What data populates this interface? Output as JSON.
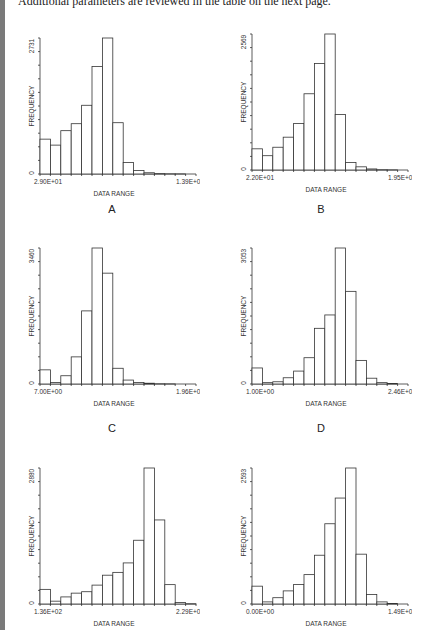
{
  "intro_text": "Additional parameters are reviewed in the table on the next page.",
  "chart_data": [
    {
      "type": "bar",
      "panel": "A",
      "title": "",
      "xlabel": "DATA RANGE",
      "ylabel": "FREQUENCY",
      "x_min_label": "2.90E+01",
      "x_max_label": "1.39E+02",
      "y_min_label": "0",
      "y_max_label": "2731",
      "ylim": [
        0,
        2731
      ],
      "bins": 15,
      "values": [
        700,
        580,
        870,
        1010,
        1380,
        2160,
        2731,
        1030,
        230,
        70,
        25,
        8,
        3,
        1,
        0
      ],
      "grid": false
    },
    {
      "type": "bar",
      "panel": "B",
      "title": "",
      "xlabel": "DATA RANGE",
      "ylabel": "FREQUENCY",
      "x_min_label": "2.20E+01",
      "x_max_label": "1.95E+02",
      "y_min_label": "0",
      "y_max_label": "2569",
      "ylim": [
        0,
        2569
      ],
      "bins": 15,
      "values": [
        400,
        270,
        430,
        620,
        880,
        1440,
        2010,
        2569,
        1050,
        140,
        60,
        20,
        5,
        2,
        0
      ],
      "grid": false
    },
    {
      "type": "bar",
      "panel": "C",
      "title": "",
      "xlabel": "DATA RANGE",
      "ylabel": "FREQUENCY",
      "x_min_label": "7.00E+00",
      "x_max_label": "1.96E+02",
      "y_min_label": "0",
      "y_max_label": "3460",
      "ylim": [
        0,
        3460
      ],
      "bins": 15,
      "values": [
        360,
        40,
        210,
        690,
        1860,
        3460,
        2820,
        400,
        100,
        40,
        20,
        5,
        2,
        0,
        0
      ],
      "grid": false
    },
    {
      "type": "bar",
      "panel": "D",
      "title": "",
      "xlabel": "DATA RANGE",
      "ylabel": "FREQUENCY",
      "x_min_label": "1.00E+00",
      "x_max_label": "2.46E+02",
      "y_min_label": "0",
      "y_max_label": "3053",
      "ylim": [
        0,
        3053
      ],
      "bins": 15,
      "values": [
        360,
        30,
        50,
        140,
        290,
        590,
        1250,
        1550,
        3053,
        2080,
        530,
        130,
        30,
        10,
        0
      ],
      "grid": false
    },
    {
      "type": "bar",
      "panel": "E",
      "title": "",
      "xlabel": "DATA RANGE",
      "ylabel": "FREQUENCY",
      "x_min_label": "1.36E+02",
      "x_max_label": "2.29E+02",
      "y_min_label": "0",
      "y_max_label": "2880",
      "ylim": [
        0,
        2880
      ],
      "bins": 15,
      "values": [
        310,
        60,
        150,
        230,
        260,
        400,
        610,
        670,
        870,
        1350,
        2880,
        1780,
        410,
        30,
        5
      ],
      "grid": false
    },
    {
      "type": "bar",
      "panel": "F",
      "title": "",
      "xlabel": "DATA RANGE",
      "ylabel": "FREQUENCY",
      "x_min_label": "0.00E+00",
      "x_max_label": "1.49E+02",
      "y_min_label": "0",
      "y_max_label": "2593",
      "ylim": [
        0,
        2593
      ],
      "bins": 15,
      "values": [
        340,
        40,
        120,
        250,
        370,
        560,
        930,
        1530,
        2020,
        2593,
        950,
        180,
        40,
        10,
        0
      ],
      "grid": false
    }
  ],
  "panels": [
    {
      "label": "A"
    },
    {
      "label": "B"
    },
    {
      "label": "C"
    },
    {
      "label": "D"
    },
    {
      "label": "E"
    },
    {
      "label": "F"
    }
  ]
}
